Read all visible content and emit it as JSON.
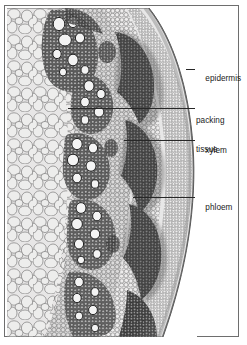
{
  "figure": {
    "kind": "micrograph",
    "caption": "",
    "frame_color": "#6e6e6e",
    "leader_color": "#272727",
    "label_color": "#1b1b1b",
    "background": "#ffffff"
  },
  "labels": [
    {
      "id": "epidermis",
      "line1": "epidermis",
      "line2": ""
    },
    {
      "id": "packing-tissue",
      "line1": "packing",
      "line2": "tissue"
    },
    {
      "id": "xylem",
      "line1": "xylem",
      "line2": ""
    },
    {
      "id": "phloem",
      "line1": "phloem",
      "line2": ""
    }
  ],
  "label_text": {
    "epidermis": "epidermis",
    "packing_line1": "packing",
    "packing_line2": "tissue",
    "xylem": "xylem",
    "phloem": "phloem"
  },
  "tissue_regions": [
    {
      "name": "packing-tissue",
      "description": "large pale rounded parenchyma cells filling the inner cortex",
      "tone": "#e9e9e9"
    },
    {
      "name": "vascular-bundles",
      "description": "dark scattered bundles arranged in a band",
      "tone": "#4a4a4a"
    },
    {
      "name": "xylem",
      "description": "large open circular vessels within each bundle",
      "tone": "#ffffff"
    },
    {
      "name": "phloem",
      "description": "dense dark small-celled arcs outside the xylem",
      "tone": "#3a3a3a"
    },
    {
      "name": "epidermis",
      "description": "thin outer boundary layer of small cells",
      "tone": "#8a8a8a"
    }
  ]
}
